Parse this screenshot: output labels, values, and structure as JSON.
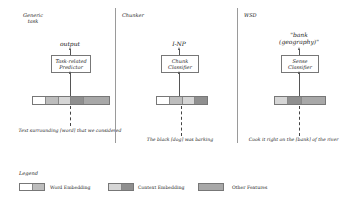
{
  "colors": {
    "word_a": "#ffffff",
    "word_b": "#bdbdbd",
    "context_a": "#d6d6d6",
    "context_b": "#8f8f8f",
    "other": "#a8a8a8"
  },
  "panels": [
    {
      "title": "Generic task",
      "output": "output",
      "predictor": "Task-related Predictor",
      "caption": "Text surrounding [word] that we considered"
    },
    {
      "title": "Chunker",
      "output": "I-NP",
      "predictor": "Chunk Classifier",
      "caption": "The black [dog] was barking"
    },
    {
      "title": "WSD",
      "output": "\"bank (geography)\"",
      "predictor": "Sense Classifier",
      "caption": "Cook it right on the [bank] of the river"
    }
  ],
  "legend": {
    "title": "Legend",
    "items": [
      {
        "label": "Word Embedding"
      },
      {
        "label": "Context Embedding"
      },
      {
        "label": "Other Features"
      }
    ]
  }
}
